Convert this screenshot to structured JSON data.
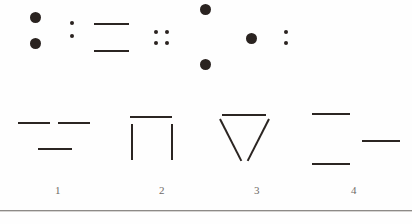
{
  "figure": {
    "kind": "abstract-pattern-test-item",
    "ink_color": "#2b2522",
    "label_color": "#6f6a66",
    "background_color": "#fefefe",
    "rule_color": "#8d8a87"
  },
  "stimulus": {
    "name": "stimulus-row",
    "groups": [
      {
        "id": "group-1",
        "description": "two large dots stacked vertically",
        "marks": [
          {
            "type": "dot",
            "size": "lg",
            "x": 10,
            "y": 12
          },
          {
            "type": "dot",
            "size": "lg",
            "x": 10,
            "y": 38
          }
        ]
      },
      {
        "id": "group-2",
        "description": "two small dots stacked vertically (colon)",
        "marks": [
          {
            "type": "dot",
            "size": "sm",
            "x": 8,
            "y": 21
          },
          {
            "type": "dot",
            "size": "sm",
            "x": 8,
            "y": 34
          }
        ]
      },
      {
        "id": "group-3",
        "description": "two horizontal bars stacked",
        "marks": [
          {
            "type": "bar",
            "x": 0,
            "y": 23,
            "w": 35
          },
          {
            "type": "bar",
            "x": 0,
            "y": 50,
            "w": 35
          }
        ]
      },
      {
        "id": "group-4",
        "description": "four small dots in a two by two grid",
        "marks": [
          {
            "type": "dot",
            "size": "sm",
            "x": 2,
            "y": 30
          },
          {
            "type": "dot",
            "size": "sm",
            "x": 13,
            "y": 30
          },
          {
            "type": "dot",
            "size": "sm",
            "x": 2,
            "y": 41
          },
          {
            "type": "dot",
            "size": "sm",
            "x": 13,
            "y": 41
          }
        ]
      },
      {
        "id": "group-5",
        "description": "two large dots far apart vertically",
        "marks": [
          {
            "type": "dot",
            "size": "lg",
            "x": 4,
            "y": 4
          },
          {
            "type": "dot",
            "size": "lg",
            "x": 4,
            "y": 59
          }
        ]
      },
      {
        "id": "group-6",
        "description": "single large dot",
        "marks": [
          {
            "type": "dot",
            "size": "lg",
            "x": 2,
            "y": 33
          }
        ]
      },
      {
        "id": "group-7",
        "description": "two small dots stacked vertically (colon)",
        "marks": [
          {
            "type": "dot",
            "size": "sm",
            "x": 2,
            "y": 30
          },
          {
            "type": "dot",
            "size": "sm",
            "x": 2,
            "y": 41
          }
        ]
      }
    ]
  },
  "options": [
    {
      "id": "option-1",
      "label": "1",
      "description": "two short bars side by side on top, one bar centered below",
      "marks": [
        {
          "type": "bar",
          "x": 10,
          "y": 22,
          "w": 32
        },
        {
          "type": "bar",
          "x": 50,
          "y": 22,
          "w": 32
        },
        {
          "type": "bar",
          "x": 30,
          "y": 48,
          "w": 34
        }
      ]
    },
    {
      "id": "option-2",
      "label": "2",
      "description": "horizontal bar on top with two vertical bars descending",
      "marks": [
        {
          "type": "bar",
          "x": 18,
          "y": 16,
          "w": 42
        },
        {
          "type": "vbar",
          "x": 19,
          "y": 24,
          "h": 36
        },
        {
          "type": "vbar",
          "x": 59,
          "y": 24,
          "h": 36
        }
      ]
    },
    {
      "id": "option-3",
      "label": "3",
      "description": "downward pointing triangle, open at the apex",
      "marks": [
        {
          "type": "bar",
          "x": 15,
          "y": 14,
          "w": 44
        },
        {
          "type": "diag",
          "x": 13,
          "y": 18,
          "len": 47,
          "angle": 63
        },
        {
          "type": "diag",
          "x": 62,
          "y": 18,
          "len": 47,
          "angle": 117
        }
      ]
    },
    {
      "id": "option-4",
      "label": "4",
      "description": "bar upper left, bar middle right, bar lower left",
      "marks": [
        {
          "type": "bar",
          "x": 8,
          "y": 13,
          "w": 38
        },
        {
          "type": "bar",
          "x": 58,
          "y": 40,
          "w": 38
        },
        {
          "type": "bar",
          "x": 8,
          "y": 63,
          "w": 38
        }
      ]
    }
  ]
}
